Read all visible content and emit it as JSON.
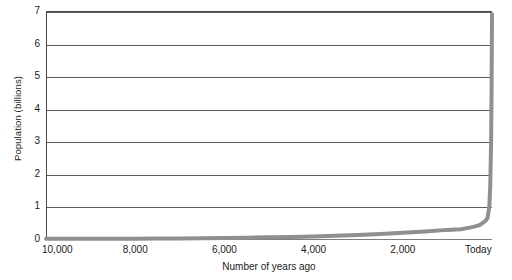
{
  "chart_data": {
    "type": "line",
    "title": "",
    "xlabel": "Number of years ago",
    "ylabel": "Population (billions)",
    "xlim": [
      10000,
      0
    ],
    "ylim": [
      0,
      7
    ],
    "x_reversed": true,
    "grid": true,
    "legend": "none",
    "y_ticks": [
      7,
      6,
      5,
      4,
      3,
      2,
      1,
      0
    ],
    "y_tick_labels": [
      "7",
      "6",
      "5",
      "4",
      "3",
      "2",
      "1",
      "0"
    ],
    "x_ticks": [
      10000,
      8000,
      6000,
      4000,
      2000,
      0
    ],
    "x_tick_labels": [
      "10,000",
      "8,000",
      "6,000",
      "4,000",
      "2,000",
      "Today"
    ],
    "series": [
      {
        "name": "World population",
        "color": "#8f8f8f",
        "line_width": 4,
        "x": [
          10000,
          9500,
          9000,
          8500,
          8000,
          7500,
          7000,
          6500,
          6000,
          5500,
          5000,
          4500,
          4000,
          3500,
          3000,
          2500,
          2000,
          1500,
          1000,
          700,
          500,
          400,
          300,
          250,
          200,
          150,
          100,
          60,
          40,
          20,
          10,
          0
        ],
        "values": [
          0.004,
          0.005,
          0.006,
          0.008,
          0.01,
          0.013,
          0.017,
          0.022,
          0.03,
          0.04,
          0.05,
          0.065,
          0.08,
          0.1,
          0.12,
          0.15,
          0.19,
          0.23,
          0.28,
          0.3,
          0.35,
          0.38,
          0.42,
          0.45,
          0.5,
          0.55,
          0.65,
          1.0,
          1.6,
          3.0,
          4.5,
          6.9
        ]
      }
    ]
  },
  "axes": {
    "y_title": "Population (billions)",
    "x_title": "Number of years ago"
  }
}
